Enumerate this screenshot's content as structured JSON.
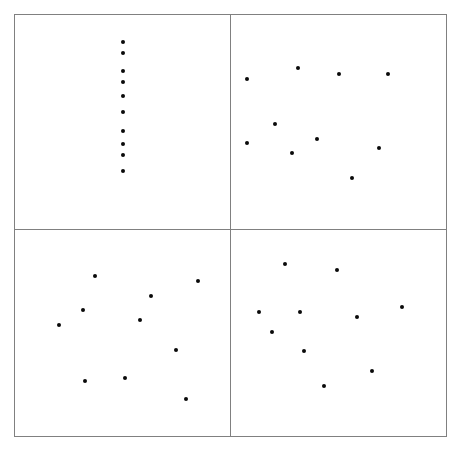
{
  "figure": {
    "title": "",
    "width": 462,
    "height": 449,
    "background_color": "#ffffff",
    "panel_border_color": "#808080",
    "marker_color": "#0a0a0a",
    "marker_size_px": 4
  },
  "chart_data": {
    "type": "scatter",
    "title": "",
    "xlabel": "",
    "ylabel": "",
    "grid": false,
    "legend": null,
    "layout": {
      "rows": 2,
      "cols": 2,
      "shared_axes": false,
      "frame_left": 14,
      "frame_top": 14,
      "frame_right": 447,
      "frame_bottom": 437,
      "divider_x": 230,
      "divider_y": 229
    },
    "panels": [
      {
        "name": "top-left",
        "position": "row-1-col-1",
        "n_points": 10,
        "pattern": "vertical-line",
        "xlim": [
          0,
          1
        ],
        "ylim": [
          0,
          1
        ],
        "points": [
          {
            "x": 0.503,
            "y": 0.873
          },
          {
            "x": 0.503,
            "y": 0.821
          },
          {
            "x": 0.503,
            "y": 0.738
          },
          {
            "x": 0.503,
            "y": 0.687
          },
          {
            "x": 0.503,
            "y": 0.622
          },
          {
            "x": 0.503,
            "y": 0.548
          },
          {
            "x": 0.503,
            "y": 0.46
          },
          {
            "x": 0.503,
            "y": 0.395
          },
          {
            "x": 0.503,
            "y": 0.344
          },
          {
            "x": 0.503,
            "y": 0.269
          }
        ]
      },
      {
        "name": "top-right",
        "position": "row-1-col-2",
        "n_points": 10,
        "pattern": "scattered",
        "xlim": [
          0,
          1
        ],
        "ylim": [
          0,
          1
        ],
        "points": [
          {
            "x": 0.074,
            "y": 0.702
          },
          {
            "x": 0.31,
            "y": 0.753
          },
          {
            "x": 0.5,
            "y": 0.726
          },
          {
            "x": 0.731,
            "y": 0.726
          },
          {
            "x": 0.204,
            "y": 0.49
          },
          {
            "x": 0.398,
            "y": 0.42
          },
          {
            "x": 0.074,
            "y": 0.402
          },
          {
            "x": 0.282,
            "y": 0.356
          },
          {
            "x": 0.69,
            "y": 0.379
          },
          {
            "x": 0.565,
            "y": 0.24
          }
        ]
      },
      {
        "name": "bottom-left",
        "position": "row-2-col-1",
        "n_points": 10,
        "pattern": "scattered",
        "xlim": [
          0,
          1
        ],
        "ylim": [
          0,
          1
        ],
        "points": [
          {
            "x": 0.37,
            "y": 0.778
          },
          {
            "x": 0.851,
            "y": 0.754
          },
          {
            "x": 0.634,
            "y": 0.681
          },
          {
            "x": 0.317,
            "y": 0.61
          },
          {
            "x": 0.583,
            "y": 0.562
          },
          {
            "x": 0.204,
            "y": 0.538
          },
          {
            "x": 0.75,
            "y": 0.418
          },
          {
            "x": 0.513,
            "y": 0.283
          },
          {
            "x": 0.324,
            "y": 0.265
          },
          {
            "x": 0.796,
            "y": 0.179
          }
        ]
      },
      {
        "name": "bottom-right",
        "position": "row-2-col-2",
        "n_points": 10,
        "pattern": "scattered",
        "xlim": [
          0,
          1
        ],
        "ylim": [
          0,
          1
        ],
        "points": [
          {
            "x": 0.253,
            "y": 0.836
          },
          {
            "x": 0.495,
            "y": 0.808
          },
          {
            "x": 0.796,
            "y": 0.625
          },
          {
            "x": 0.132,
            "y": 0.601
          },
          {
            "x": 0.322,
            "y": 0.601
          },
          {
            "x": 0.587,
            "y": 0.577
          },
          {
            "x": 0.192,
            "y": 0.505
          },
          {
            "x": 0.341,
            "y": 0.413
          },
          {
            "x": 0.656,
            "y": 0.317
          },
          {
            "x": 0.434,
            "y": 0.245
          }
        ]
      }
    ]
  }
}
